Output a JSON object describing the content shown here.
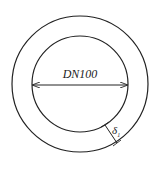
{
  "diagram": {
    "diameter_label": "DN100",
    "thickness_label": "δ",
    "thickness_subscript": "1",
    "outer_circle": {
      "cx": 80,
      "cy": 84,
      "r": 68
    },
    "inner_circle": {
      "cx": 80,
      "cy": 84,
      "r": 48
    },
    "line_color": "#222222"
  }
}
